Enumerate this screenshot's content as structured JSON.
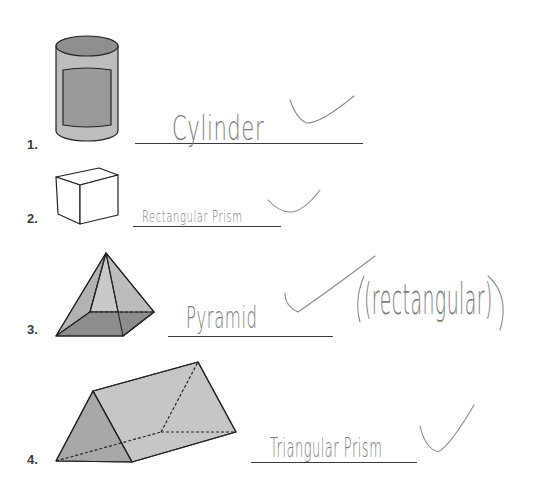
{
  "worksheet": {
    "items": [
      {
        "number": "1.",
        "shape": "cylinder",
        "answer": "Cylinder",
        "mark": "check"
      },
      {
        "number": "2.",
        "shape": "rectangular-prism",
        "answer": "Rectangular Prism",
        "mark": "check"
      },
      {
        "number": "3.",
        "shape": "pyramid",
        "answer": "Pyramid",
        "note": "(rectangular)",
        "mark": "check"
      },
      {
        "number": "4.",
        "shape": "triangular-prism",
        "answer": "Triangular Prism",
        "mark": "check"
      }
    ]
  },
  "colors": {
    "outline": "#222222",
    "shape_light": "#c8c8c8",
    "shape_mid": "#a9a9a9",
    "shape_dark": "#8a8a8a",
    "pencil": "#7a7a7a"
  }
}
